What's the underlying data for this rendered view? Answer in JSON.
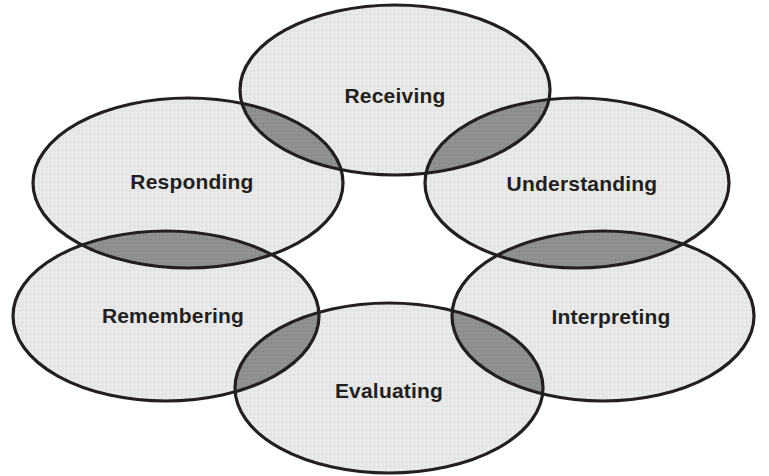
{
  "diagram": {
    "type": "venn",
    "canvas": {
      "width": 769,
      "height": 476,
      "background": "#ffffff"
    },
    "style": {
      "ellipse_fill": "#e7e7e7",
      "overlap_fill": "#8f8f8f",
      "stroke_color": "#231f20",
      "stroke_width": 3.2,
      "label_color": "#231f20",
      "label_font_size": 21,
      "label_font_weight": "bold"
    },
    "nodes": [
      {
        "id": "receiving",
        "label": "Receiving",
        "cx": 395,
        "cy": 90,
        "rx": 155,
        "ry": 85,
        "label_x": 395,
        "label_y": 97
      },
      {
        "id": "understanding",
        "label": "Understanding",
        "cx": 577,
        "cy": 183,
        "rx": 152,
        "ry": 85,
        "label_x": 582,
        "label_y": 185
      },
      {
        "id": "interpreting",
        "label": "Interpreting",
        "cx": 603,
        "cy": 316,
        "rx": 151,
        "ry": 85,
        "label_x": 611,
        "label_y": 318
      },
      {
        "id": "evaluating",
        "label": "Evaluating",
        "cx": 389,
        "cy": 388,
        "rx": 154,
        "ry": 85,
        "label_x": 389,
        "label_y": 392
      },
      {
        "id": "remembering",
        "label": "Remembering",
        "cx": 166,
        "cy": 316,
        "rx": 153,
        "ry": 85,
        "label_x": 173,
        "label_y": 317
      },
      {
        "id": "responding",
        "label": "Responding",
        "cx": 188,
        "cy": 183,
        "rx": 155,
        "ry": 85,
        "label_x": 192,
        "label_y": 183
      }
    ],
    "overlaps": [
      {
        "id": "receiving-responding",
        "a": "receiving",
        "b": "responding"
      },
      {
        "id": "receiving-understanding",
        "a": "receiving",
        "b": "understanding"
      },
      {
        "id": "understanding-interpreting",
        "a": "understanding",
        "b": "interpreting"
      },
      {
        "id": "interpreting-evaluating",
        "a": "interpreting",
        "b": "evaluating"
      },
      {
        "id": "evaluating-remembering",
        "a": "evaluating",
        "b": "remembering"
      },
      {
        "id": "remembering-responding",
        "a": "remembering",
        "b": "responding"
      }
    ]
  }
}
